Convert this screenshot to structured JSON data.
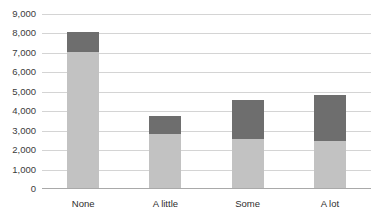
{
  "chart_data": {
    "type": "bar",
    "title": "",
    "subtitle": "",
    "xlabel": "",
    "ylabel": "",
    "stacked": true,
    "grid": true,
    "legend": "none",
    "ylim": [
      0,
      9000
    ],
    "ytick_labels": [
      "9,000",
      "8,000",
      "7,000",
      "6,000",
      "5,000",
      "4,000",
      "3,000",
      "2,000",
      "1,000",
      "0"
    ],
    "ytick_values": [
      9000,
      8000,
      7000,
      6000,
      5000,
      4000,
      3000,
      2000,
      1000,
      0
    ],
    "categories": [
      "None",
      "A little",
      "Some",
      "A lot"
    ],
    "series": [
      {
        "name": "lower-segment",
        "color": "#c2c2c2",
        "values": [
          7000,
          2800,
          2500,
          2400
        ]
      },
      {
        "name": "upper-segment",
        "color": "#6e6e6e",
        "values": [
          1000,
          900,
          2050,
          2400
        ]
      }
    ],
    "totals": [
      8000,
      3700,
      4550,
      4800
    ]
  },
  "colors": {
    "background": "#ffffff",
    "gridline": "#d4d4d4",
    "axis": "#a9a9a9",
    "tick_text": "#3b3b3b",
    "category_text": "#2e2e2e"
  }
}
